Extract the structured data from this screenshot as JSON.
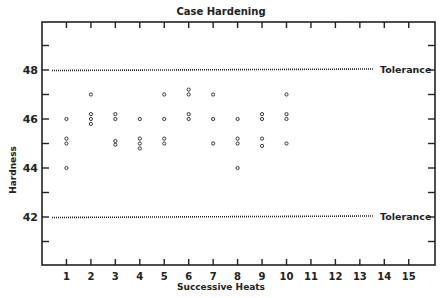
{
  "chart_data": {
    "type": "scatter",
    "title": "Case Hardening",
    "xlabel": "Successive Heats",
    "ylabel": "Hardness",
    "x_ticks": [
      1,
      2,
      3,
      4,
      5,
      6,
      7,
      8,
      9,
      10,
      11,
      12,
      13,
      14,
      15
    ],
    "y_tick_labels": [
      42,
      44,
      46,
      48
    ],
    "xlim": [
      0,
      16
    ],
    "ylim": [
      40,
      50
    ],
    "grid": false,
    "reference_lines": [
      {
        "label": "Tolerance",
        "y": 48,
        "style": "dotted"
      },
      {
        "label": "Tolerance",
        "y": 42,
        "style": "dotted"
      }
    ],
    "series": [
      {
        "name": "Hardness readings",
        "points": [
          {
            "x": 1,
            "y": 46.0
          },
          {
            "x": 1,
            "y": 45.2
          },
          {
            "x": 1,
            "y": 45.0
          },
          {
            "x": 1,
            "y": 44.0
          },
          {
            "x": 2,
            "y": 47.0
          },
          {
            "x": 2,
            "y": 46.2
          },
          {
            "x": 2,
            "y": 46.0
          },
          {
            "x": 2,
            "y": 45.8
          },
          {
            "x": 3,
            "y": 46.2
          },
          {
            "x": 3,
            "y": 46.0
          },
          {
            "x": 3,
            "y": 45.1
          },
          {
            "x": 3,
            "y": 44.95
          },
          {
            "x": 4,
            "y": 46.0
          },
          {
            "x": 4,
            "y": 45.2
          },
          {
            "x": 4,
            "y": 45.0
          },
          {
            "x": 4,
            "y": 44.8
          },
          {
            "x": 5,
            "y": 47.0
          },
          {
            "x": 5,
            "y": 46.0
          },
          {
            "x": 5,
            "y": 45.2
          },
          {
            "x": 5,
            "y": 45.0
          },
          {
            "x": 6,
            "y": 47.2
          },
          {
            "x": 6,
            "y": 47.0
          },
          {
            "x": 6,
            "y": 46.2
          },
          {
            "x": 6,
            "y": 46.0
          },
          {
            "x": 7,
            "y": 47.0
          },
          {
            "x": 7,
            "y": 46.0
          },
          {
            "x": 7,
            "y": 45.0
          },
          {
            "x": 8,
            "y": 46.0
          },
          {
            "x": 8,
            "y": 45.2
          },
          {
            "x": 8,
            "y": 45.0
          },
          {
            "x": 8,
            "y": 44.0
          },
          {
            "x": 9,
            "y": 46.2
          },
          {
            "x": 9,
            "y": 46.0
          },
          {
            "x": 9,
            "y": 45.2
          },
          {
            "x": 9,
            "y": 44.9
          },
          {
            "x": 10,
            "y": 47.0
          },
          {
            "x": 10,
            "y": 46.2
          },
          {
            "x": 10,
            "y": 46.0
          },
          {
            "x": 10,
            "y": 45.0
          }
        ]
      }
    ]
  },
  "colors": {
    "ink": "#222222",
    "background": "#ffffff"
  }
}
